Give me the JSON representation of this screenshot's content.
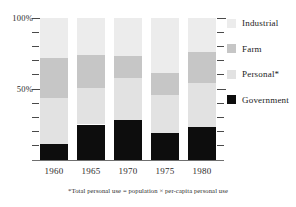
{
  "chart_data": {
    "type": "bar",
    "title": "",
    "subtitle": "",
    "xlabel": "",
    "ylabel": "",
    "stacked": true,
    "normalized": true,
    "grid": false,
    "legend_position": "right",
    "ylim": [
      0,
      100
    ],
    "y_tick_labels": [
      "100%",
      "50%"
    ],
    "y_ticks_major": [
      100,
      50
    ],
    "y_ticks_minor_step": 10,
    "categories": [
      "1960",
      "1965",
      "1970",
      "1975",
      "1980"
    ],
    "series": [
      {
        "name": "Industrial",
        "color": "#ececec",
        "values": [
          79,
          74,
          73,
          61,
          76
        ]
      },
      {
        "name": "Farm",
        "color": "#c6c6c6",
        "values": [
          51,
          51,
          58,
          46,
          54
        ]
      },
      {
        "name": "Personal",
        "color": "#e2e2e2",
        "values": [
          11,
          25,
          28,
          19,
          23
        ]
      },
      {
        "name": "Government",
        "color": "#0d0d0d",
        "values": [
          11,
          25,
          28,
          19,
          23
        ]
      }
    ],
    "segments_by_category": [
      {
        "category": "1960",
        "industrial": 28,
        "farm": 28,
        "personal": 33,
        "government": 11
      },
      {
        "category": "1965",
        "industrial": 26,
        "farm": 23,
        "personal": 26,
        "government": 25
      },
      {
        "category": "1970",
        "industrial": 27,
        "farm": 15,
        "personal": 30,
        "government": 28
      },
      {
        "category": "1975",
        "industrial": 39,
        "farm": 15,
        "personal": 27,
        "government": 19
      },
      {
        "category": "1980",
        "industrial": 24,
        "farm": 22,
        "personal": 31,
        "government": 23
      }
    ],
    "annotations": [
      "*Total personal use = population × per-capita personal use"
    ]
  },
  "legend": {
    "items": [
      {
        "label": "Industrial",
        "color": "#ececec"
      },
      {
        "label": "Farm",
        "color": "#c6c6c6"
      },
      {
        "label": "Personal*",
        "color": "#e2e2e2"
      },
      {
        "label": "Government",
        "color": "#0d0d0d"
      }
    ]
  },
  "axes": {
    "y_labels": [
      {
        "text": "100%",
        "value": 100
      },
      {
        "text": "50%",
        "value": 50
      }
    ],
    "x_labels": [
      "1960",
      "1965",
      "1970",
      "1975",
      "1980"
    ]
  },
  "footnote": {
    "text": "*Total personal use = population × per-capita personal use"
  }
}
